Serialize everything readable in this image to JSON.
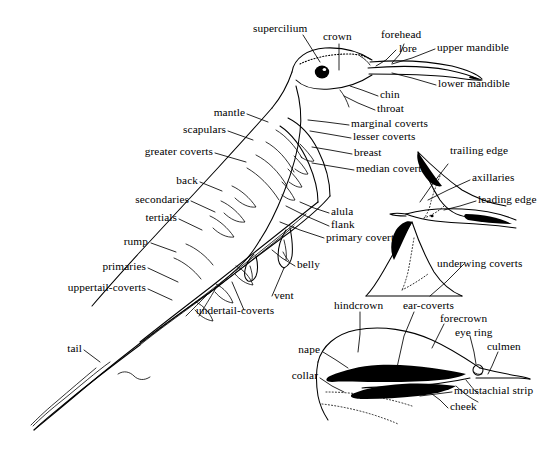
{
  "figure": {
    "ink_color": "#000000",
    "background_color": "#ffffff"
  },
  "head_labels": [
    {
      "id": "supercilium",
      "text": "supercilium"
    },
    {
      "id": "crown",
      "text": "crown"
    },
    {
      "id": "forehead",
      "text": "forehead"
    },
    {
      "id": "lore",
      "text": "lore"
    },
    {
      "id": "upper-mandible",
      "text": "upper mandible"
    },
    {
      "id": "lower-mandible",
      "text": "lower mandible"
    },
    {
      "id": "chin",
      "text": "chin"
    },
    {
      "id": "throat",
      "text": "throat"
    }
  ],
  "upperpart_labels": [
    {
      "id": "mantle",
      "text": "mantle"
    },
    {
      "id": "scapulars",
      "text": "scapulars"
    },
    {
      "id": "greater-coverts",
      "text": "greater coverts"
    },
    {
      "id": "back",
      "text": "back"
    },
    {
      "id": "secondaries",
      "text": "secondaries"
    },
    {
      "id": "tertials",
      "text": "tertials"
    },
    {
      "id": "rump",
      "text": "rump"
    },
    {
      "id": "primaries",
      "text": "primaries"
    },
    {
      "id": "uppertail-coverts",
      "text": "uppertail-coverts"
    },
    {
      "id": "tail",
      "text": "tail"
    }
  ],
  "underpart_labels": [
    {
      "id": "marginal-coverts",
      "text": "marginal coverts"
    },
    {
      "id": "lesser-coverts",
      "text": "lesser coverts"
    },
    {
      "id": "breast",
      "text": "breast"
    },
    {
      "id": "median-coverts",
      "text": "median coverts"
    },
    {
      "id": "alula",
      "text": "alula"
    },
    {
      "id": "flank",
      "text": "flank"
    },
    {
      "id": "primary-coverts",
      "text": "primary coverts"
    },
    {
      "id": "belly",
      "text": "belly"
    },
    {
      "id": "vent",
      "text": "vent"
    },
    {
      "id": "undertail-coverts",
      "text": "undertail-coverts"
    }
  ],
  "wing_labels": [
    {
      "id": "trailing-edge",
      "text": "trailing edge"
    },
    {
      "id": "axillaries",
      "text": "axillaries"
    },
    {
      "id": "leading-edge",
      "text": "leading edge"
    },
    {
      "id": "underwing-coverts",
      "text": "underwing coverts"
    }
  ],
  "head_detail_labels": [
    {
      "id": "hindcrown",
      "text": "hindcrown"
    },
    {
      "id": "ear-coverts",
      "text": "ear-coverts"
    },
    {
      "id": "forecrown",
      "text": "forecrown"
    },
    {
      "id": "eye-ring",
      "text": "eye ring"
    },
    {
      "id": "culmen",
      "text": "culmen"
    },
    {
      "id": "nape",
      "text": "nape"
    },
    {
      "id": "collar",
      "text": "collar"
    },
    {
      "id": "moustachial-stripe",
      "text": "moustachial strip"
    },
    {
      "id": "cheek",
      "text": "cheek"
    }
  ]
}
